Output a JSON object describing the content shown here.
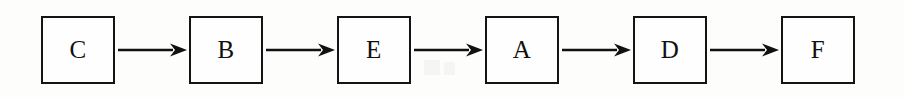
{
  "diagram": {
    "type": "linear-flowchart",
    "orientation": "horizontal",
    "title": "",
    "sequence": "C -> B -> E -> A -> D -> F",
    "node_count": 6,
    "edge_count": 5,
    "colors": {
      "background": "#fdfdfc",
      "node_fill": "#fefefe",
      "node_border": "#141414",
      "label_text": "#101010",
      "arrow": "#111111"
    },
    "nodes": [
      {
        "id": "n1",
        "label": "C"
      },
      {
        "id": "n2",
        "label": "B"
      },
      {
        "id": "n3",
        "label": "E"
      },
      {
        "id": "n4",
        "label": "A"
      },
      {
        "id": "n5",
        "label": "D"
      },
      {
        "id": "n6",
        "label": "F"
      }
    ],
    "edges": [
      {
        "from": "C",
        "to": "B",
        "style": "solid-arrow"
      },
      {
        "from": "B",
        "to": "E",
        "style": "solid-arrow"
      },
      {
        "from": "E",
        "to": "A",
        "style": "solid-arrow"
      },
      {
        "from": "A",
        "to": "D",
        "style": "solid-arrow"
      },
      {
        "from": "D",
        "to": "F",
        "style": "solid-arrow"
      }
    ]
  }
}
